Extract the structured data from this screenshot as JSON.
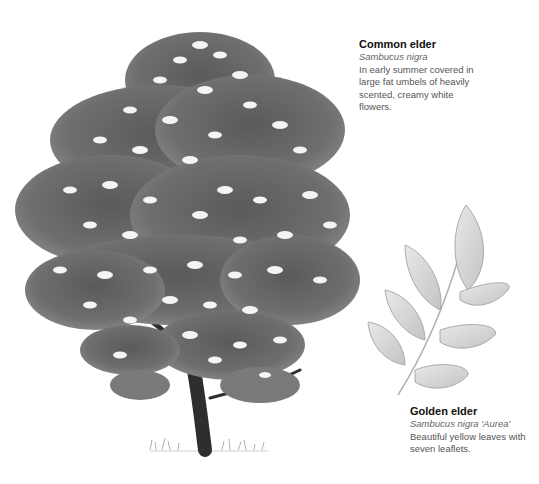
{
  "plants": [
    {
      "name": "Common elder",
      "latin": "Sambucus nigra",
      "description": "In early summer covered in large fat umbels of heavily scented, creamy white flowers.",
      "illustration": "tree-illustration"
    },
    {
      "name": "Golden elder",
      "latin": "Sambucus nigra 'Aurea'",
      "description": "Beautiful yellow leaves with seven leaflets.",
      "illustration": "leaf-illustration"
    }
  ],
  "colors": {
    "background": "#ffffff",
    "foliage_dark": "#4a4a4a",
    "foliage_mid": "#7a7a7a",
    "flowers": "#f2f2f2",
    "leaf": "#d8d8d8",
    "title": "#111111",
    "body_text": "#555555"
  }
}
